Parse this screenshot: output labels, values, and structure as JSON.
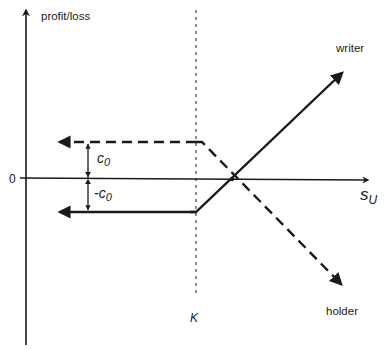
{
  "diagram": {
    "type": "option payoff diagram",
    "colors": {
      "line": "#1a1a1a",
      "background": "#ffffff"
    },
    "axes": {
      "y_label": "profit/loss",
      "x_label_main": "s",
      "x_label_sub": "U",
      "origin_label": "0"
    },
    "strike": {
      "label": "K"
    },
    "premium": {
      "upper_label_main": "c",
      "upper_label_sub": "0",
      "lower_label_main": "-c",
      "lower_label_sub": "0"
    },
    "series": [
      {
        "name": "writer",
        "label": "writer",
        "style": "solid",
        "flat_level": "-c0",
        "slope": "positive after K"
      },
      {
        "name": "holder",
        "label": "holder",
        "style": "dashed",
        "flat_level": "c0",
        "slope": "negative after K"
      }
    ]
  }
}
